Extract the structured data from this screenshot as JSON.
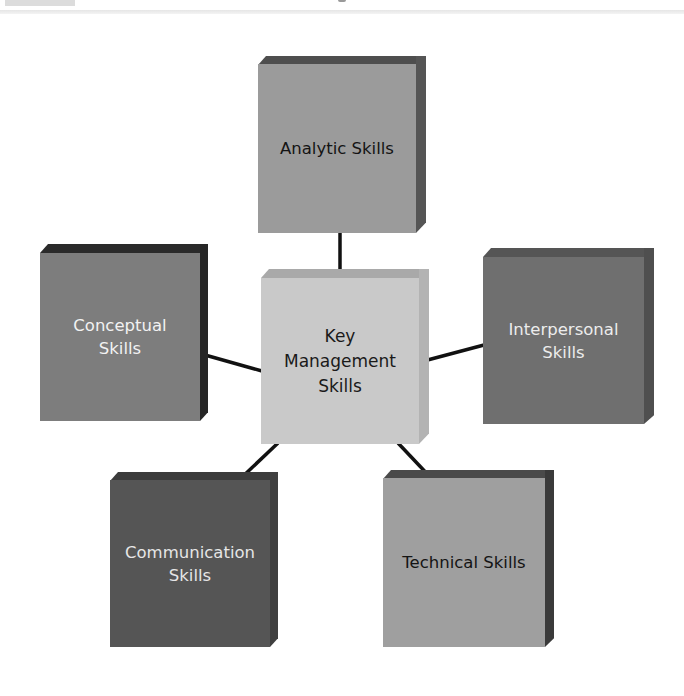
{
  "diagram": {
    "center": {
      "lines": [
        "Key",
        "Management",
        "Skills"
      ],
      "color_front": "#c9c9c9",
      "color_top": "#a9a9a9",
      "color_side": "#b5b5b5",
      "text_color": "#1a1a1a"
    },
    "nodes": [
      {
        "id": "analytic",
        "lines": [
          "Analytic Skills"
        ],
        "color_front": "#9b9b9b",
        "color_top": "#4e4e4e",
        "color_side": "#555555",
        "text_color": "#141414"
      },
      {
        "id": "conceptual",
        "lines": [
          "Conceptual",
          "Skills"
        ],
        "color_front": "#7d7d7d",
        "color_top": "#2a2a2a",
        "color_side": "#262626",
        "text_color": "#f2f2f2"
      },
      {
        "id": "interpersonal",
        "lines": [
          "Interpersonal",
          "Skills"
        ],
        "color_front": "#6f6f6f",
        "color_top": "#555555",
        "color_side": "#4f4f4f",
        "text_color": "#ececec"
      },
      {
        "id": "communication",
        "lines": [
          "Communication",
          "Skills"
        ],
        "color_front": "#555555",
        "color_top": "#3c3c3c",
        "color_side": "#404040",
        "text_color": "#e6e6e6"
      },
      {
        "id": "technical",
        "lines": [
          "Technical Skills"
        ],
        "color_front": "#9f9f9f",
        "color_top": "#4a4a4a",
        "color_side": "#3a3a3a",
        "text_color": "#141414"
      }
    ],
    "connector_color": "#111111"
  }
}
